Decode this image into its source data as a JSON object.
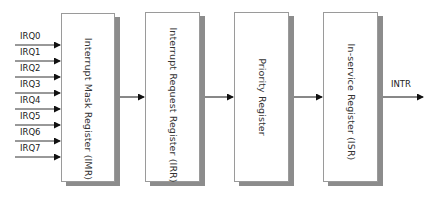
{
  "diagram": {
    "title": "",
    "inputs": [
      {
        "label": "IRQ0",
        "y": 45
      },
      {
        "label": "IRQ1",
        "y": 61
      },
      {
        "label": "IRQ2",
        "y": 77
      },
      {
        "label": "IRQ3",
        "y": 93
      },
      {
        "label": "IRQ4",
        "y": 109
      },
      {
        "label": "IRQ5",
        "y": 125
      },
      {
        "label": "IRQ6",
        "y": 141
      },
      {
        "label": "IRQ7",
        "y": 157
      }
    ],
    "blocks": [
      {
        "id": "imr",
        "label": "Interrupt Mask Register (IMR)"
      },
      {
        "id": "irr",
        "label": "Interrupt Request Register (IRR)"
      },
      {
        "id": "priority",
        "label": "Priority Register"
      },
      {
        "id": "isr",
        "label": "In-service Register (ISR)"
      }
    ],
    "edges": [
      {
        "from": "IRQ0-IRQ7",
        "to": "imr"
      },
      {
        "from": "imr",
        "to": "irr"
      },
      {
        "from": "irr",
        "to": "priority"
      },
      {
        "from": "priority",
        "to": "isr"
      },
      {
        "from": "isr",
        "to": "INTR"
      }
    ],
    "output": {
      "label": "INTR"
    },
    "colors": {
      "line": "#111111",
      "border": "#9a9a9a",
      "shadow": "#8c8c8c"
    }
  }
}
